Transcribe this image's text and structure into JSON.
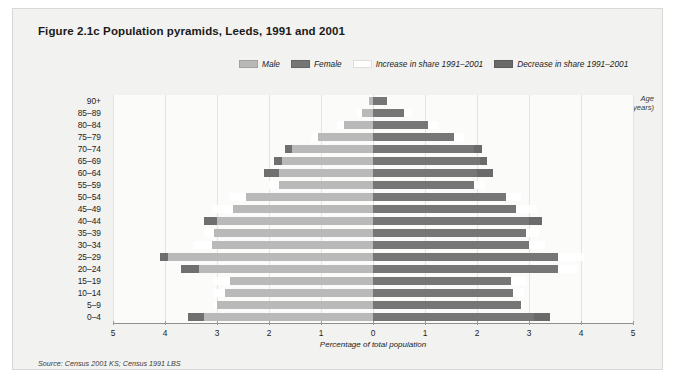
{
  "figure": {
    "title": "Figure 2.1c  Population pyramids, Leeds, 1991 and 2001",
    "source": "Source: Census 2001 KS; Census 1991 LBS"
  },
  "legend": {
    "items": [
      {
        "label": "Male",
        "color": "#b9b9b9"
      },
      {
        "label": "Female",
        "color": "#767676"
      },
      {
        "label": "Increase in share 1991–2001",
        "color": "#ffffff"
      },
      {
        "label": "Decrease in share 1991–2001",
        "color": "#6a6a6a"
      }
    ]
  },
  "axes": {
    "y_title_line1": "Age",
    "y_title_line2": "(years)",
    "x_title": "Percentage of total population",
    "x_ticks": [
      "5",
      "4",
      "3",
      "2",
      "1",
      "0",
      "1",
      "2",
      "3",
      "4",
      "5"
    ],
    "x_tick_values": [
      -5,
      -4,
      -3,
      -2,
      -1,
      0,
      1,
      2,
      3,
      4,
      5
    ],
    "x_min": -5,
    "x_max": 5
  },
  "chart_data": {
    "type": "bar",
    "subtype": "population-pyramid",
    "title": "Figure 2.1c  Population pyramids, Leeds, 1991 and 2001",
    "xlabel": "Percentage of total population",
    "ylabel": "Age (years)",
    "xlim": [
      -5,
      5
    ],
    "grid": true,
    "legend_position": "top-center",
    "note": "Male values plotted to the left of zero, female to the right. Each bar's outer cap shows the change in share between 1991 and 2001: white = increase, dark grey = decrease. 'total_2001' is the 2001 share; 'total_1991' is the implied 1991 share.",
    "categories": [
      "90+",
      "85–89",
      "80–84",
      "75–79",
      "70–74",
      "65–69",
      "60–64",
      "55–59",
      "50–54",
      "45–49",
      "40–44",
      "35–39",
      "30–34",
      "25–29",
      "20–24",
      "15–19",
      "10–14",
      "5–9",
      "0–4"
    ],
    "series": [
      {
        "name": "Male",
        "side": "left",
        "color": "#b9b9b9",
        "total_2001": [
          0.1,
          0.3,
          0.7,
          1.2,
          1.55,
          1.75,
          1.8,
          2.0,
          2.75,
          3.1,
          3.0,
          3.25,
          3.45,
          3.95,
          3.35,
          3.05,
          3.05,
          3.05,
          3.25
        ],
        "total_1991": [
          0.07,
          0.22,
          0.55,
          1.05,
          1.7,
          1.9,
          2.1,
          1.8,
          2.45,
          2.7,
          3.25,
          3.05,
          3.1,
          4.1,
          3.7,
          2.75,
          2.85,
          3.0,
          3.55
        ],
        "change": [
          0.03,
          0.08,
          0.15,
          0.15,
          -0.15,
          -0.15,
          -0.3,
          0.2,
          0.3,
          0.4,
          -0.25,
          0.2,
          0.35,
          -0.15,
          -0.35,
          0.3,
          0.2,
          0.05,
          -0.3
        ]
      },
      {
        "name": "Female",
        "side": "right",
        "color": "#767676",
        "total_2001": [
          0.35,
          0.75,
          1.25,
          1.75,
          1.95,
          2.05,
          2.0,
          2.15,
          2.85,
          3.15,
          3.0,
          3.2,
          3.3,
          4.05,
          3.95,
          2.95,
          2.9,
          2.9,
          3.1
        ],
        "total_1991": [
          0.27,
          0.6,
          1.05,
          1.55,
          2.1,
          2.2,
          2.3,
          1.95,
          2.55,
          2.75,
          3.25,
          2.95,
          3.0,
          3.55,
          3.55,
          2.65,
          2.7,
          2.85,
          3.4
        ],
        "change": [
          0.08,
          0.15,
          0.2,
          0.2,
          -0.15,
          -0.15,
          -0.3,
          0.2,
          0.3,
          0.4,
          -0.25,
          0.25,
          0.3,
          0.5,
          0.4,
          0.3,
          0.2,
          0.05,
          -0.3
        ]
      }
    ]
  }
}
